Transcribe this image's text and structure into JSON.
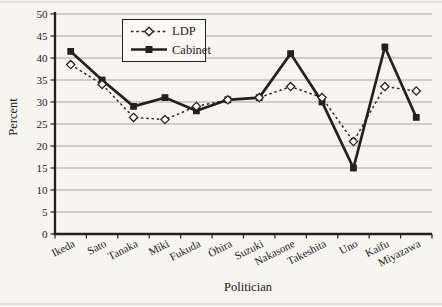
{
  "chart_data": {
    "type": "line",
    "title": "",
    "xlabel": "Politician",
    "ylabel": "Percent",
    "categories": [
      "Ikeda",
      "Sato",
      "Tanaka",
      "Miki",
      "Fukuda",
      "Ōhira",
      "Suzuki",
      "Nakasone",
      "Takeshita",
      "Uno",
      "Kaifu",
      "Miyazawa"
    ],
    "series": [
      {
        "name": "LDP",
        "style": "dashed-open-diamond",
        "values": [
          38.5,
          34,
          26.5,
          26,
          29,
          30.5,
          31,
          33.5,
          31,
          21,
          33.5,
          32.5
        ]
      },
      {
        "name": "Cabinet",
        "style": "solid-filled-square",
        "values": [
          41.5,
          35,
          29,
          31,
          28,
          30.5,
          31,
          41,
          30,
          15,
          42.5,
          26.5
        ]
      }
    ],
    "ylim": [
      0,
      50
    ],
    "yticks": [
      0,
      5,
      10,
      15,
      20,
      25,
      30,
      35,
      40,
      45,
      50
    ],
    "grid": "horizontal",
    "legend_position": "top-inside",
    "colors": {
      "ink": "#24211d",
      "grid": "#a9a59e",
      "marker_open_fill": "#ffffff"
    }
  }
}
